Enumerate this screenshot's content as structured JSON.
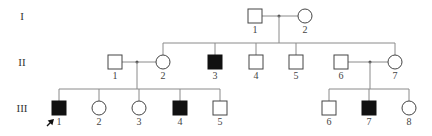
{
  "diagram": {
    "type": "pedigree",
    "generations": [
      {
        "label": "I",
        "y": 16
      },
      {
        "label": "II",
        "y": 62
      },
      {
        "label": "III",
        "y": 108
      }
    ],
    "individuals": [
      {
        "id": "I-1",
        "gen": 0,
        "num": "1",
        "sex": "male",
        "affected": false,
        "x": 255
      },
      {
        "id": "I-2",
        "gen": 0,
        "num": "2",
        "sex": "female",
        "affected": false,
        "x": 305
      },
      {
        "id": "II-1",
        "gen": 1,
        "num": "1",
        "sex": "male",
        "affected": false,
        "x": 115
      },
      {
        "id": "II-2",
        "gen": 1,
        "num": "2",
        "sex": "female",
        "affected": false,
        "x": 163
      },
      {
        "id": "II-3",
        "gen": 1,
        "num": "3",
        "sex": "male",
        "affected": true,
        "x": 215
      },
      {
        "id": "II-4",
        "gen": 1,
        "num": "4",
        "sex": "male",
        "affected": false,
        "x": 256
      },
      {
        "id": "II-5",
        "gen": 1,
        "num": "5",
        "sex": "male",
        "affected": false,
        "x": 296
      },
      {
        "id": "II-6",
        "gen": 1,
        "num": "6",
        "sex": "male",
        "affected": false,
        "x": 341
      },
      {
        "id": "II-7",
        "gen": 1,
        "num": "7",
        "sex": "female",
        "affected": false,
        "x": 395
      },
      {
        "id": "III-1",
        "gen": 2,
        "num": "1",
        "sex": "male",
        "affected": true,
        "proband": true,
        "x": 59
      },
      {
        "id": "III-2",
        "gen": 2,
        "num": "2",
        "sex": "female",
        "affected": false,
        "x": 99
      },
      {
        "id": "III-3",
        "gen": 2,
        "num": "3",
        "sex": "female",
        "affected": false,
        "x": 139
      },
      {
        "id": "III-4",
        "gen": 2,
        "num": "4",
        "sex": "male",
        "affected": true,
        "x": 180
      },
      {
        "id": "III-5",
        "gen": 2,
        "num": "5",
        "sex": "male",
        "affected": false,
        "x": 220
      },
      {
        "id": "III-6",
        "gen": 2,
        "num": "6",
        "sex": "male",
        "affected": false,
        "x": 329
      },
      {
        "id": "III-7",
        "gen": 2,
        "num": "7",
        "sex": "male",
        "affected": true,
        "x": 369
      },
      {
        "id": "III-8",
        "gen": 2,
        "num": "8",
        "sex": "female",
        "affected": false,
        "x": 409
      }
    ],
    "matings": [
      {
        "partners": [
          "I-1",
          "I-2"
        ],
        "children": [
          "II-2",
          "II-3",
          "II-4",
          "II-5",
          "II-7"
        ]
      },
      {
        "partners": [
          "II-1",
          "II-2"
        ],
        "children": [
          "III-1",
          "III-2",
          "III-3",
          "III-4",
          "III-5"
        ]
      },
      {
        "partners": [
          "II-6",
          "II-7"
        ],
        "children": [
          "III-6",
          "III-7",
          "III-8"
        ]
      }
    ],
    "proband": "III-1"
  }
}
